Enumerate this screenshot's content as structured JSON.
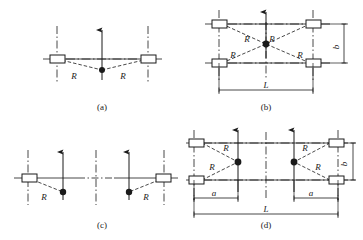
{
  "figure": {
    "type": "engineering-diagram",
    "background_color": "#ffffff",
    "line_color": "#1a1a1a",
    "panels": [
      {
        "id": "a",
        "caption": "(a)",
        "caption_x": 102,
        "caption_y": 108,
        "boxes": 2,
        "dots": 1,
        "radius_labels": [
          {
            "text": "R",
            "x": 74,
            "y": 76
          },
          {
            "text": "R",
            "x": 123,
            "y": 76
          }
        ],
        "dimension_labels": []
      },
      {
        "id": "b",
        "caption": "(b)",
        "caption_x": 266,
        "caption_y": 108,
        "boxes": 4,
        "dots": 1,
        "radius_labels": [
          {
            "text": "R",
            "x": 247,
            "y": 39
          },
          {
            "text": "R",
            "x": 270,
            "y": 39
          },
          {
            "text": "R",
            "x": 231,
            "y": 56
          },
          {
            "text": "R",
            "x": 288,
            "y": 56
          }
        ],
        "dimension_labels": [
          {
            "text": "L",
            "x": 268,
            "y": 91
          },
          {
            "text": "b",
            "x": 339,
            "y": 51
          }
        ]
      },
      {
        "id": "c",
        "caption": "(c)",
        "caption_x": 102,
        "caption_y": 227,
        "boxes": 2,
        "dots": 2,
        "radius_labels": [
          {
            "text": "R",
            "x": 44,
            "y": 199
          },
          {
            "text": "R",
            "x": 143,
            "y": 199
          }
        ],
        "dimension_labels": []
      },
      {
        "id": "d",
        "caption": "(d)",
        "caption_x": 266,
        "caption_y": 227,
        "boxes": 4,
        "dots": 2,
        "radius_labels": [
          {
            "text": "R",
            "x": 228,
            "y": 150
          },
          {
            "text": "R",
            "x": 212,
            "y": 166
          },
          {
            "text": "R",
            "x": 300,
            "y": 150
          },
          {
            "text": "R",
            "x": 315,
            "y": 166
          }
        ],
        "dimension_labels": [
          {
            "text": "a",
            "x": 212,
            "y": 201
          },
          {
            "text": "a",
            "x": 309,
            "y": 201
          },
          {
            "text": "L",
            "x": 266,
            "y": 215
          },
          {
            "text": "b",
            "x": 339,
            "y": 166
          }
        ]
      }
    ],
    "symbols": {
      "box": "conductor-bundle-rectangle",
      "dot": "reference-point-filled-circle",
      "arrow": "upward-vertical-arrow",
      "dashdot": "centerline-dash-dot",
      "dashed": "distance-dashed-line"
    }
  }
}
